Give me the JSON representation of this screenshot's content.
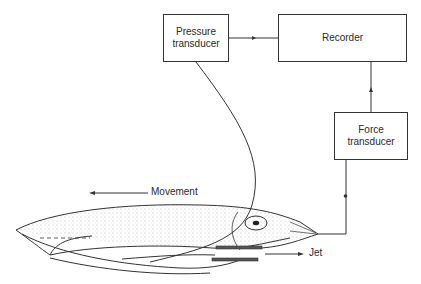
{
  "diagram": {
    "boxes": {
      "pressure": {
        "line1": "Pressure",
        "line2": "transducer"
      },
      "recorder": {
        "label": "Recorder"
      },
      "force": {
        "line1": "Force",
        "line2": "transducer"
      }
    },
    "labels": {
      "movement": "Movement",
      "jet": "Jet"
    },
    "connections": [
      {
        "from": "Pressure transducer",
        "to": "Recorder"
      },
      {
        "from": "Force transducer",
        "to": "Recorder"
      },
      {
        "from": "Squid mantle",
        "to": "Pressure transducer"
      },
      {
        "from": "Squid head",
        "to": "Force transducer"
      }
    ],
    "colors": {
      "line": "#333333",
      "text": "#2a2a2a",
      "background": "#ffffff"
    }
  }
}
